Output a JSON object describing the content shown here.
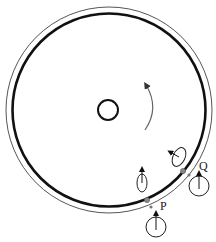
{
  "diagram": {
    "title": "",
    "labels": {
      "p": "P",
      "q": "Q"
    },
    "colors": {
      "stroke": "#111111",
      "thin_ring": "#444444",
      "arrow": "#555555",
      "dot": "#888888"
    },
    "elements": [
      {
        "name": "outer-thin-ring",
        "type": "circle"
      },
      {
        "name": "thick-disc-ring",
        "type": "circle"
      },
      {
        "name": "center-hole",
        "type": "circle"
      },
      {
        "name": "rotation-arrow",
        "type": "curved-arrow",
        "direction": "counterclockwise"
      },
      {
        "name": "point-p",
        "label": "P"
      },
      {
        "name": "point-q",
        "label": "Q"
      },
      {
        "name": "ellipse-near-p",
        "arrow": "up"
      },
      {
        "name": "ellipse-near-q",
        "arrow": "up-left"
      },
      {
        "name": "circle-below-p",
        "arrow": "up"
      },
      {
        "name": "circle-below-q",
        "arrow": "up"
      }
    ]
  }
}
